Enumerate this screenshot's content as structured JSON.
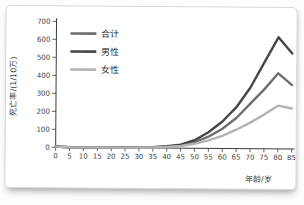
{
  "figure": {
    "frame_color": "#d9d9d9",
    "background_color": "#ffffff"
  },
  "chart_data": {
    "type": "line",
    "title": "",
    "xlabel": "年龄/岁",
    "ylabel": "死亡率/(1/10万)",
    "xlim": [
      0,
      85
    ],
    "ylim": [
      0,
      700
    ],
    "x_ticks": [
      0,
      5,
      10,
      15,
      20,
      25,
      30,
      35,
      40,
      45,
      50,
      55,
      60,
      65,
      70,
      75,
      80,
      85
    ],
    "y_ticks": [
      0,
      100,
      200,
      300,
      400,
      500,
      600,
      700
    ],
    "grid": false,
    "legend_position": "top-left-inside",
    "x": [
      0,
      5,
      10,
      15,
      20,
      25,
      30,
      35,
      40,
      45,
      50,
      55,
      60,
      65,
      70,
      75,
      80,
      85
    ],
    "series": [
      {
        "key": "total",
        "name": "合计",
        "color": "#6e6e6e",
        "values": [
          4,
          1,
          1,
          1,
          1,
          2,
          3,
          4,
          8,
          15,
          35,
          65,
          110,
          170,
          250,
          330,
          420,
          355
        ]
      },
      {
        "key": "male",
        "name": "男性",
        "color": "#474747",
        "values": [
          5,
          1,
          1,
          1,
          2,
          2,
          3,
          5,
          10,
          20,
          45,
          90,
          150,
          230,
          340,
          480,
          620,
          530
        ]
      },
      {
        "key": "female",
        "name": "女性",
        "color": "#b3b3b3",
        "values": [
          4,
          1,
          1,
          1,
          1,
          1,
          2,
          3,
          6,
          12,
          25,
          45,
          70,
          105,
          145,
          190,
          240,
          225
        ]
      }
    ]
  }
}
